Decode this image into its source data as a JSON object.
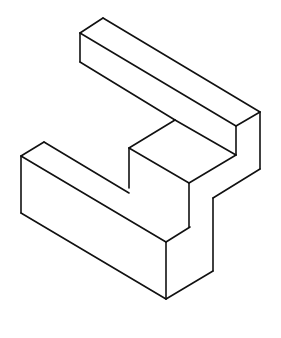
{
  "figure": {
    "type": "isometric-line-drawing",
    "stroke_color": "#111111",
    "background": "#ffffff",
    "edges": [
      [
        103,
        18,
        80,
        33
      ],
      [
        103,
        18,
        260,
        112
      ],
      [
        80,
        33,
        236,
        126
      ],
      [
        80,
        33,
        80,
        62
      ],
      [
        80,
        62,
        175,
        120
      ],
      [
        236,
        126,
        260,
        112
      ],
      [
        236,
        126,
        236,
        155
      ],
      [
        260,
        112,
        260,
        169
      ],
      [
        175,
        120,
        236,
        155
      ],
      [
        175,
        120,
        129,
        148
      ],
      [
        236,
        155,
        189,
        183
      ],
      [
        129,
        148,
        189,
        183
      ],
      [
        129,
        148,
        129,
        188
      ],
      [
        189,
        183,
        189,
        227
      ],
      [
        260,
        169,
        213,
        198
      ],
      [
        213,
        198,
        213,
        271
      ],
      [
        44,
        142,
        21,
        156
      ],
      [
        44,
        142,
        129,
        193
      ],
      [
        21,
        156,
        166,
        242
      ],
      [
        21,
        156,
        21,
        213
      ],
      [
        21,
        213,
        166,
        299
      ],
      [
        166,
        242,
        190,
        227
      ],
      [
        166,
        242,
        166,
        299
      ],
      [
        166,
        299,
        213,
        271
      ]
    ]
  }
}
